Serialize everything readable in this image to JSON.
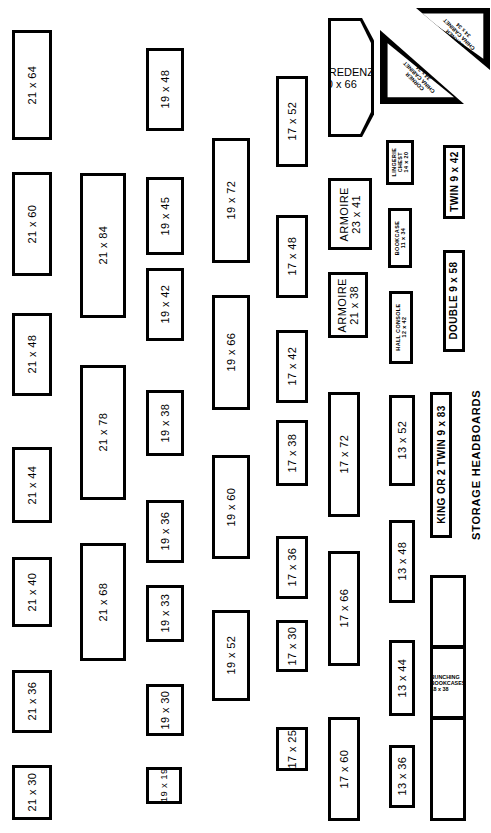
{
  "sheet": {
    "title": "Furniture Template Sheet",
    "units_note": "inches",
    "stroke_color": "#000000",
    "fill_color": "#ffffff"
  },
  "columns": [
    {
      "name": "col-21-narrow",
      "items": [
        {
          "label": "21 x 64"
        },
        {
          "label": "21 x 60"
        },
        {
          "label": "21 x 48"
        },
        {
          "label": "21 x 44"
        },
        {
          "label": "21 x 40"
        },
        {
          "label": "21 x 36"
        },
        {
          "label": "21 x 30"
        }
      ]
    },
    {
      "name": "col-21-wide",
      "items": [
        {
          "label": "21 x 84"
        },
        {
          "label": "21 x 78"
        },
        {
          "label": "21 x 68"
        }
      ]
    },
    {
      "name": "col-19-short",
      "items": [
        {
          "label": "19 x 48"
        },
        {
          "label": "19 x 45"
        },
        {
          "label": "19 x 42"
        },
        {
          "label": "19 x 38"
        },
        {
          "label": "19 x 36"
        },
        {
          "label": "19 x 33"
        },
        {
          "label": "19 x 30"
        },
        {
          "label": "19 x 19"
        }
      ]
    },
    {
      "name": "col-19-long",
      "items": [
        {
          "label": "19 x 72"
        },
        {
          "label": "19 x 66"
        },
        {
          "label": "19 x 60"
        },
        {
          "label": "19 x 52"
        }
      ]
    },
    {
      "name": "col-17-short",
      "items": [
        {
          "label": "17 x 52"
        },
        {
          "label": "17 x 48"
        },
        {
          "label": "17 x 42"
        },
        {
          "label": "17 x 38"
        },
        {
          "label": "17 x 36"
        },
        {
          "label": "17 x 30"
        },
        {
          "label": "17 x 25"
        }
      ]
    },
    {
      "name": "col-named-and-17-long",
      "items": [
        {
          "label": "CREDENZA\n20 x 66",
          "line1": "CREDENZA",
          "line2": "20 x 66"
        },
        {
          "label": "ARMOIRE\n23 x 41",
          "line1": "ARMOIRE",
          "line2": "23 x 41"
        },
        {
          "label": "ARMOIRE\n21 x 38",
          "line1": "ARMOIRE",
          "line2": "21 x 38"
        },
        {
          "label": "17 x 72"
        },
        {
          "label": "17 x 66"
        },
        {
          "label": "17 x 60"
        }
      ]
    },
    {
      "name": "col-small-named-and-13",
      "items": [
        {
          "line1": "CORNER",
          "line2": "CHINA CABINET",
          "line3": "34 x 34"
        },
        {
          "line1": "CORNER",
          "line2": "CHINA CABINET",
          "line3": "34 x 34"
        },
        {
          "line1": "LINGERIE",
          "line2": "CHEST",
          "line3": "14 x 20"
        },
        {
          "line1": "BOOKCASE",
          "line2": "11 x 34"
        },
        {
          "line1": "HALL CONSOLE",
          "line2": "12 x 42"
        },
        {
          "label": "13 x 52"
        },
        {
          "label": "13 x 48"
        },
        {
          "label": "13 x 44"
        },
        {
          "label": "13 x 36"
        }
      ]
    },
    {
      "name": "col-headboards-bookcases",
      "items": [
        {
          "label": "TWIN 9 x 42"
        },
        {
          "label": "DOUBLE 9 x 58"
        },
        {
          "label": "KING OR 2 TWIN 9 x 83"
        },
        {
          "line1": "BUNCHING",
          "line2": "BOOKCASES",
          "line3": "18 x 38"
        }
      ],
      "external_labels": [
        {
          "label": "STORAGE  HEADBOARDS"
        }
      ]
    }
  ]
}
